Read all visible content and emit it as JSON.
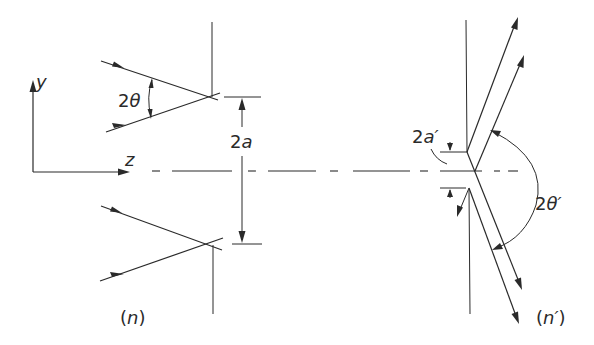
{
  "diagram": {
    "axes": {
      "y_label": "y",
      "z_label": "z"
    },
    "left_panel": {
      "angle_label_num": "2",
      "angle_label_sym": "θ",
      "separation_label_num": "2",
      "separation_label_sym": "a",
      "medium_label_open": "(",
      "medium_label_sym": "n",
      "medium_label_close": ")"
    },
    "right_panel": {
      "separation_label_num": "2",
      "separation_label_sym": "a′",
      "angle_label_num": "2",
      "angle_label_sym": "θ′",
      "medium_label_open": "(",
      "medium_label_sym": "n′",
      "medium_label_close": ")"
    },
    "colors": {
      "stroke": "#2a2a2a",
      "background": "#ffffff"
    }
  }
}
